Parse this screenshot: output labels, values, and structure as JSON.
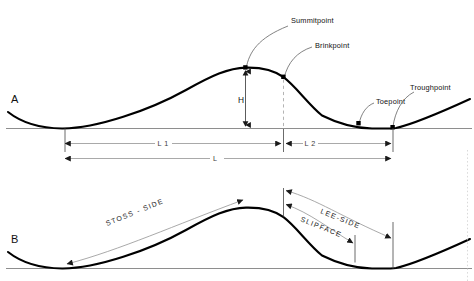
{
  "figure": {
    "type": "dune-profile-morphology-diagram",
    "panels": [
      {
        "id": "A",
        "letter": "A",
        "description": "Dune profile with named morphological points and length/height dimensions"
      },
      {
        "id": "B",
        "letter": "B",
        "description": "Dune profile with named surface zones"
      }
    ]
  },
  "panel_a": {
    "letter": "A",
    "callouts": [
      {
        "key": "summitpoint",
        "label": "Summitpoint"
      },
      {
        "key": "brinkpoint",
        "label": "Brinkpoint"
      },
      {
        "key": "toepoint",
        "label": "Toepoint"
      },
      {
        "key": "troughpoint",
        "label": "Troughpoint"
      }
    ],
    "dimensions": [
      {
        "key": "height",
        "label": "H"
      },
      {
        "key": "stoss_length",
        "label": "L 1"
      },
      {
        "key": "lee_length",
        "label": "L 2"
      },
      {
        "key": "total_length",
        "label": "L"
      }
    ]
  },
  "panel_b": {
    "letter": "B",
    "zones": [
      {
        "key": "stoss_side",
        "label": "STOSS - SIDE"
      },
      {
        "key": "lee_side",
        "label": "LEE-SIDE"
      },
      {
        "key": "slipface",
        "label": "SLIPFACE"
      }
    ]
  },
  "colors": {
    "curve": "#000000",
    "baseline": "#8e8e8e",
    "leader": "#6d6d6d",
    "dimension": "#9a9a9a",
    "dashed": "#b4b4b4",
    "text": "#111111",
    "background": "#ffffff"
  }
}
